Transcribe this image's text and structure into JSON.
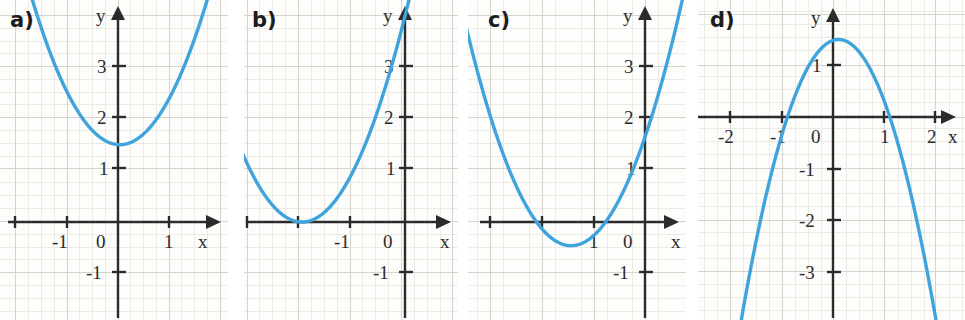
{
  "figure": {
    "background": "#fdfdfc",
    "curve_color": "#3fa4db",
    "axis_color": "#2b2b2b",
    "grid_major_color": "#d8d8d2",
    "grid_minor_color": "#ebebe6"
  },
  "panels": {
    "a": {
      "label": "a)",
      "x_axis_label": "x",
      "y_axis_label": "y",
      "x_ticks": [
        "-1",
        "0",
        "1"
      ],
      "y_ticks": [
        "3",
        "2",
        "1",
        "-1"
      ]
    },
    "b": {
      "label": "b)",
      "x_axis_label": "x",
      "y_axis_label": "y",
      "x_ticks": [
        "-1",
        "0"
      ],
      "y_ticks": [
        "3",
        "2",
        "1",
        "-1"
      ]
    },
    "c": {
      "label": "c)",
      "x_axis_label": "x",
      "y_axis_label": "y",
      "x_ticks": [
        "1",
        "0"
      ],
      "y_ticks": [
        "3",
        "2",
        "1",
        "-1"
      ]
    },
    "d": {
      "label": "d)",
      "x_axis_label": "x",
      "y_axis_label": "y",
      "x_ticks": [
        "-2",
        "-1",
        "0",
        "1",
        "2"
      ],
      "y_ticks": [
        "1",
        "-1",
        "-2",
        "-3"
      ]
    }
  },
  "chart_data": [
    {
      "id": "a",
      "type": "line",
      "title": "a)",
      "xlabel": "x",
      "ylabel": "y",
      "xlim": [
        -2.3,
        2.3
      ],
      "ylim": [
        -1.9,
        4.3
      ],
      "grid": true,
      "vertex": [
        0.05,
        1.5
      ],
      "equation": "y = x^2 + 1.5",
      "x_ticklabels": [
        "-1",
        "0",
        "1"
      ],
      "x_tickvalues": [
        -1,
        0,
        1
      ],
      "y_ticklabels": [
        "3",
        "2",
        "1",
        "-1"
      ],
      "y_tickvalues": [
        3,
        2,
        1,
        -1
      ],
      "x": [
        -1.7,
        -1.5,
        -1.25,
        -1.0,
        -0.75,
        -0.5,
        -0.25,
        0,
        0.25,
        0.5,
        0.75,
        1.0,
        1.25,
        1.5,
        1.7
      ],
      "y": [
        4.37,
        3.75,
        3.19,
        2.6,
        2.14,
        1.8,
        1.59,
        1.5,
        1.54,
        1.7,
        1.99,
        2.4,
        2.94,
        3.6,
        4.22
      ]
    },
    {
      "id": "b",
      "type": "line",
      "title": "b)",
      "xlabel": "x",
      "ylabel": "y",
      "xlim": [
        -4.3,
        1.1
      ],
      "ylim": [
        -1.9,
        4.3
      ],
      "grid": true,
      "vertex": [
        -2.0,
        0.0
      ],
      "equation": "y = (x + 2)^2",
      "x_ticklabels": [
        "-1",
        "0"
      ],
      "x_tickvalues": [
        -1,
        0
      ],
      "y_ticklabels": [
        "3",
        "2",
        "1",
        "-1"
      ],
      "y_tickvalues": [
        3,
        2,
        1,
        -1
      ],
      "x": [
        -3.05,
        -2.9,
        -2.7,
        -2.5,
        -2.25,
        -2.0,
        -1.75,
        -1.5,
        -1.25,
        -1.0,
        -0.75,
        -0.5,
        -0.25,
        0,
        0.1
      ],
      "y": [
        1.1,
        0.81,
        0.49,
        0.25,
        0.06,
        0.0,
        0.06,
        0.25,
        0.56,
        1.0,
        1.56,
        2.25,
        3.06,
        4.0,
        4.41
      ]
    },
    {
      "id": "c",
      "type": "line",
      "title": "c)",
      "xlabel": "x",
      "ylabel": "y",
      "xlim": [
        -3.3,
        1.1
      ],
      "ylim": [
        -1.9,
        4.3
      ],
      "grid": true,
      "vertex": [
        -1.45,
        -0.45
      ],
      "equation": "y = (x + 1.45)^2 - 0.45",
      "x_ticklabels": [
        "1",
        "0"
      ],
      "x_tickvalues": [
        -1,
        0
      ],
      "y_ticklabels": [
        "3",
        "2",
        "1",
        "-1"
      ],
      "y_tickvalues": [
        3,
        2,
        1,
        -1
      ],
      "x": [
        -3.0,
        -2.75,
        -2.5,
        -2.25,
        -2.0,
        -1.75,
        -1.45,
        -1.25,
        -1.0,
        -0.75,
        -0.5,
        -0.25,
        0,
        0.25,
        0.5
      ],
      "y": [
        2.15,
        1.24,
        0.65,
        0.19,
        -0.15,
        -0.36,
        -0.45,
        -0.41,
        -0.25,
        0.04,
        0.45,
        0.99,
        1.65,
        2.44,
        3.35
      ]
    },
    {
      "id": "d",
      "type": "line",
      "title": "d)",
      "xlabel": "x",
      "ylabel": "y",
      "xlim": [
        -2.6,
        2.6
      ],
      "ylim": [
        -3.9,
        2.3
      ],
      "grid": true,
      "vertex": [
        0.1,
        1.5
      ],
      "equation": "y = -1.5(x - 0.1)^2 + 1.5",
      "x_ticklabels": [
        "-2",
        "-1",
        "0",
        "1",
        "2"
      ],
      "x_tickvalues": [
        -2,
        -1,
        0,
        1,
        2
      ],
      "y_ticklabels": [
        "1",
        "-1",
        "-2",
        "-3"
      ],
      "y_tickvalues": [
        1,
        -1,
        -2,
        -3
      ],
      "x": [
        -1.55,
        -1.4,
        -1.2,
        -1.0,
        -0.75,
        -0.5,
        -0.25,
        0.1,
        0.35,
        0.6,
        0.85,
        1.1,
        1.3,
        1.5,
        1.7
      ],
      "y": [
        -2.58,
        -2.0,
        -1.31,
        -0.32,
        0.39,
        1.0,
        1.34,
        1.5,
        1.41,
        1.13,
        0.65,
        0.0,
        -0.66,
        -1.44,
        -2.34
      ]
    }
  ]
}
